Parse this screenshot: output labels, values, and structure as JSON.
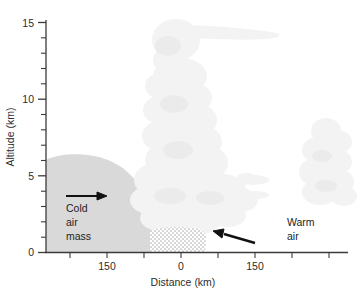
{
  "figure": {
    "name": "warm-front-cross-section",
    "background_color": "#ffffff"
  },
  "axes": {
    "y": {
      "title": "Altitude (km)",
      "major_ticks": [
        "0",
        "5",
        "10",
        "15"
      ],
      "minor_interval": 1,
      "range": [
        0,
        15.6
      ]
    },
    "x": {
      "title": "Distance (km)",
      "labels": [
        "150",
        "0",
        "150"
      ],
      "label_values": [
        -150,
        0,
        150
      ],
      "tick_interval": 50,
      "range": [
        -250,
        260
      ]
    }
  },
  "annotations": {
    "cold_air": {
      "line1": "Cold",
      "line2": "air",
      "line3": "mass"
    },
    "warm_air": {
      "line1": "Warm",
      "line2": "air"
    },
    "cold_arrow": {
      "name": "cold-air-flow-arrow",
      "direction": "right"
    },
    "warm_arrow": {
      "name": "warm-air-flow-arrow",
      "direction": "left"
    }
  },
  "elements": {
    "cold_air_mass": {
      "label": "cold-air-wedge",
      "color": "#d9d9d9"
    },
    "cumulonimbus": {
      "label": "cumulonimbus-cloud",
      "color": "#f3f3f3"
    },
    "anvil": {
      "label": "anvil-top",
      "color": "#f3f3f3"
    },
    "precipitation": {
      "label": "precipitation-stipple",
      "color": "#b9b9b9"
    },
    "altocumulus": {
      "label": "altocumulus-puffs",
      "color": "#f0f0f0"
    },
    "right_cumulus": {
      "label": "right-cumulus-stack",
      "color": "#f1f1f1"
    }
  },
  "colors": {
    "axis": "#3b3b3b",
    "text": "#2d2d2d",
    "cloud": "#f3f3f3",
    "cold_mass": "#d9d9d9",
    "arrow": "#111111"
  }
}
